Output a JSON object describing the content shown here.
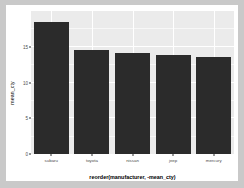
{
  "chart_data": {
    "type": "bar",
    "title": "",
    "xlabel": "reorder(manufacturer, -mean_cty)",
    "ylabel": "mean_cty",
    "categories": [
      "subaru",
      "toyota",
      "nissan",
      "jeep",
      "mercury"
    ],
    "values": [
      18.5,
      14.6,
      14.1,
      13.8,
      13.5
    ],
    "ylim": [
      0,
      20
    ],
    "yticks": [
      0,
      5,
      10,
      15
    ],
    "ytick_labels": [
      "0",
      "5",
      "10",
      "15"
    ],
    "grid": true,
    "legend": "none",
    "bar_color": "#2b2b2b",
    "panel_background": "#ebebeb",
    "grid_color": "#ffffff",
    "figure_background": "#ffffff",
    "page_background": "#c9c9c9"
  }
}
